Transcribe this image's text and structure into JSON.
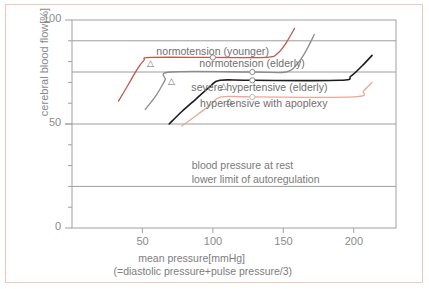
{
  "chart_data": {
    "type": "line",
    "title": "",
    "xlabel": "mean pressure[mmHg]",
    "xlabel_sub": "(=diastolic pressure+pulse pressure/3)",
    "ylabel": "cerebral blood flow[%]",
    "xlim": [
      0,
      230
    ],
    "ylim": [
      0,
      100
    ],
    "xticks": [
      50,
      100,
      150,
      200
    ],
    "xtick_labels": [
      "50",
      "100",
      "150",
      "200"
    ],
    "yticks": [
      0,
      10,
      20,
      30,
      40,
      50,
      60,
      70,
      80,
      90,
      100
    ],
    "ytick_labels": [
      "0",
      "50",
      "100"
    ],
    "ytick_labeled_values": [
      0,
      50,
      100
    ],
    "gridlines_y": [
      20,
      50,
      75,
      90
    ],
    "grid": true,
    "legend_position": "inline-on-curves",
    "annotations": [
      "blood pressure at rest",
      "lower limit of autoregulation"
    ],
    "marker_legend": {
      "circle": "blood pressure at rest",
      "triangle": "lower limit of autoregulation"
    },
    "series": [
      {
        "name": "normotension (younger)",
        "color": "#c0584d",
        "label_x": 100,
        "label_y": 84.5,
        "rest_marker": {
          "x": 100,
          "y": 82
        },
        "lower_limit_marker": {
          "x": 56,
          "y": 79
        },
        "points": [
          {
            "x": 33,
            "y": 61
          },
          {
            "x": 40,
            "y": 69
          },
          {
            "x": 46,
            "y": 76
          },
          {
            "x": 51,
            "y": 80.5
          },
          {
            "x": 56,
            "y": 82
          },
          {
            "x": 100,
            "y": 82
          },
          {
            "x": 138,
            "y": 82
          },
          {
            "x": 146,
            "y": 84
          },
          {
            "x": 152,
            "y": 89
          },
          {
            "x": 158,
            "y": 96
          }
        ]
      },
      {
        "name": "normotension (elderly)",
        "color": "#8b8b90",
        "label_x": 128,
        "label_y": 79,
        "rest_marker": {
          "x": 128,
          "y": 75
        },
        "lower_limit_marker": {
          "x": 71,
          "y": 70
        },
        "points": [
          {
            "x": 52,
            "y": 57
          },
          {
            "x": 60,
            "y": 64
          },
          {
            "x": 66,
            "y": 71
          },
          {
            "x": 70,
            "y": 75
          },
          {
            "x": 128,
            "y": 75
          },
          {
            "x": 152,
            "y": 75
          },
          {
            "x": 160,
            "y": 79
          },
          {
            "x": 166,
            "y": 85
          },
          {
            "x": 172,
            "y": 93
          }
        ]
      },
      {
        "name": "severe hypertensive (elderly)",
        "color": "#1c1c1c",
        "label_x": 133,
        "label_y": 67.5,
        "rest_marker": {
          "x": 128,
          "y": 71
        },
        "lower_limit_marker": {
          "x": 108,
          "y": 68
        },
        "points": [
          {
            "x": 69,
            "y": 50
          },
          {
            "x": 78,
            "y": 56
          },
          {
            "x": 88,
            "y": 62
          },
          {
            "x": 98,
            "y": 68
          },
          {
            "x": 105,
            "y": 71
          },
          {
            "x": 128,
            "y": 71
          },
          {
            "x": 190,
            "y": 71
          },
          {
            "x": 198,
            "y": 73
          },
          {
            "x": 206,
            "y": 78
          },
          {
            "x": 213,
            "y": 83
          }
        ]
      },
      {
        "name": "hypertensive with apoplexy",
        "color": "#eaa898",
        "label_x": 136,
        "label_y": 59.5,
        "rest_marker": {
          "x": 128,
          "y": 63
        },
        "lower_limit_marker": {
          "x": 112,
          "y": 60.5
        },
        "points": [
          {
            "x": 78,
            "y": 49
          },
          {
            "x": 88,
            "y": 54
          },
          {
            "x": 98,
            "y": 59
          },
          {
            "x": 106,
            "y": 63
          },
          {
            "x": 128,
            "y": 63
          },
          {
            "x": 200,
            "y": 63
          },
          {
            "x": 207,
            "y": 66
          },
          {
            "x": 213,
            "y": 70
          }
        ]
      }
    ]
  },
  "colors": {
    "frame_border": "#f0c9bd",
    "axis": "#a0a0a0",
    "grid": "#9c9c9c",
    "text": "#7d7d7d"
  }
}
